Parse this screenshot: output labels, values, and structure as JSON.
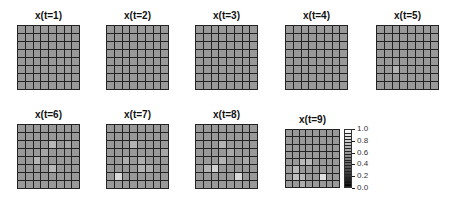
{
  "chart_data": {
    "type": "heatmap",
    "title": "",
    "grid_size": [
      8,
      8
    ],
    "color_scale": {
      "min": 0.0,
      "max": 1.0,
      "ticks": [
        "1.0",
        "0.8",
        "0.6",
        "0.4",
        "0.2",
        "0.0"
      ],
      "colormap": "grayscale"
    },
    "base_value": 0.6,
    "panels": [
      {
        "title": "x(t=1)",
        "highlights": []
      },
      {
        "title": "x(t=2)",
        "highlights": []
      },
      {
        "title": "x(t=3)",
        "highlights": []
      },
      {
        "title": "x(t=4)",
        "highlights": []
      },
      {
        "title": "x(t=5)",
        "highlights": [
          [
            5,
            2,
            0.7
          ]
        ]
      },
      {
        "title": "x(t=6)",
        "highlights": [
          [
            2,
            4,
            0.72
          ],
          [
            4,
            2,
            0.7
          ],
          [
            5,
            4,
            0.72
          ],
          [
            3,
            3,
            0.65
          ],
          [
            2,
            6,
            0.65
          ]
        ]
      },
      {
        "title": "x(t=7)",
        "highlights": [
          [
            6,
            1,
            0.85
          ],
          [
            2,
            3,
            0.7
          ],
          [
            4,
            2,
            0.68
          ],
          [
            4,
            4,
            0.68
          ],
          [
            5,
            4,
            0.7
          ],
          [
            5,
            5,
            0.68
          ],
          [
            3,
            7,
            0.65
          ]
        ]
      },
      {
        "title": "x(t=8)",
        "highlights": [
          [
            5,
            2,
            0.82
          ],
          [
            6,
            5,
            0.85
          ],
          [
            2,
            3,
            0.7
          ],
          [
            4,
            3,
            0.7
          ],
          [
            5,
            1,
            0.7
          ],
          [
            3,
            4,
            0.66
          ],
          [
            4,
            6,
            0.66
          ]
        ]
      },
      {
        "title": "x(t=9)",
        "highlights": [
          [
            6,
            5,
            0.88
          ],
          [
            6,
            1,
            0.75
          ],
          [
            5,
            1,
            0.72
          ],
          [
            4,
            2,
            0.72
          ],
          [
            4,
            3,
            0.72
          ],
          [
            7,
            2,
            0.68
          ],
          [
            6,
            2,
            0.72
          ]
        ]
      }
    ]
  }
}
